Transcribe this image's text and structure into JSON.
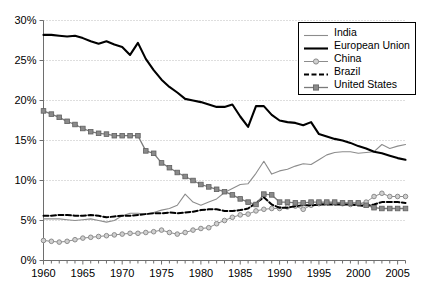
{
  "chart_data": {
    "type": "line",
    "title": "",
    "xlabel": "",
    "ylabel": "",
    "xlim": [
      1960,
      2006
    ],
    "ylim": [
      0,
      30
    ],
    "grid": true,
    "y_tick_labels": [
      "0%",
      "5%",
      "10%",
      "15%",
      "20%",
      "25%",
      "30%"
    ],
    "y_ticks": [
      0,
      5,
      10,
      15,
      20,
      25,
      30
    ],
    "x_tick_labels": [
      "1960",
      "1965",
      "1970",
      "1975",
      "1980",
      "1985",
      "1990",
      "1995",
      "2000",
      "2005"
    ],
    "x_ticks": [
      1960,
      1965,
      1970,
      1975,
      1980,
      1985,
      1990,
      1995,
      2000,
      2005
    ],
    "x_minor_step": 1,
    "legend_position": "top-right",
    "x": [
      1960,
      1961,
      1962,
      1963,
      1964,
      1965,
      1966,
      1967,
      1968,
      1969,
      1970,
      1971,
      1972,
      1973,
      1974,
      1975,
      1976,
      1977,
      1978,
      1979,
      1980,
      1981,
      1982,
      1983,
      1984,
      1985,
      1986,
      1987,
      1988,
      1989,
      1990,
      1991,
      1992,
      1993,
      1994,
      1995,
      1996,
      1997,
      1998,
      1999,
      2000,
      2001,
      2002,
      2003,
      2004,
      2005,
      2006
    ],
    "series": [
      {
        "name": "India",
        "color": "#8c8c8c",
        "style": "solid",
        "width": 1.1,
        "marker": "none",
        "values": [
          5.2,
          5.2,
          5.2,
          5.1,
          5.0,
          5.1,
          5.2,
          5.0,
          4.8,
          5.0,
          5.6,
          5.9,
          5.9,
          5.8,
          6.0,
          6.3,
          6.5,
          6.9,
          8.3,
          7.3,
          6.9,
          7.3,
          7.7,
          8.5,
          9.0,
          9.5,
          9.6,
          10.9,
          12.4,
          10.8,
          11.2,
          11.4,
          11.8,
          12.1,
          12.0,
          12.6,
          13.2,
          13.5,
          13.6,
          13.6,
          13.4,
          13.5,
          13.6,
          14.5,
          14.0,
          14.3,
          14.5
        ]
      },
      {
        "name": "European Union",
        "color": "#000000",
        "style": "solid",
        "width": 2.1,
        "marker": "none",
        "values": [
          28.2,
          28.2,
          28.1,
          28.0,
          28.1,
          27.8,
          27.4,
          27.1,
          27.4,
          27.0,
          26.7,
          25.7,
          27.2,
          25.2,
          23.8,
          22.6,
          21.7,
          21.0,
          20.2,
          20.0,
          19.8,
          19.5,
          19.2,
          19.2,
          19.5,
          18.0,
          16.7,
          19.3,
          19.3,
          18.2,
          17.5,
          17.3,
          17.2,
          16.9,
          17.3,
          15.8,
          15.5,
          15.2,
          15.0,
          14.7,
          14.3,
          14.0,
          13.6,
          13.4,
          13.1,
          12.8,
          12.6
        ]
      },
      {
        "name": "China",
        "color": "#8c8c8c",
        "style": "solid",
        "width": 1.0,
        "marker": "circle",
        "values": [
          2.5,
          2.4,
          2.3,
          2.4,
          2.6,
          2.8,
          2.9,
          3.0,
          3.1,
          3.2,
          3.3,
          3.4,
          3.4,
          3.5,
          3.6,
          3.8,
          3.5,
          3.3,
          3.5,
          3.8,
          4.0,
          4.1,
          4.6,
          5.0,
          5.4,
          5.7,
          5.8,
          6.2,
          6.4,
          6.5,
          6.5,
          6.7,
          6.8,
          6.4,
          6.9,
          7.1,
          7.2,
          7.2,
          7.1,
          7.0,
          7.1,
          7.3,
          8.0,
          8.4,
          8.0,
          8.0,
          8.0
        ]
      },
      {
        "name": "Brazil",
        "color": "#000000",
        "style": "dashed",
        "width": 2.0,
        "marker": "none",
        "values": [
          5.6,
          5.6,
          5.7,
          5.7,
          5.6,
          5.6,
          5.7,
          5.6,
          5.4,
          5.5,
          5.6,
          5.6,
          5.7,
          5.8,
          5.9,
          5.9,
          6.0,
          5.9,
          6.0,
          6.1,
          6.3,
          6.4,
          6.4,
          6.2,
          6.2,
          6.3,
          6.5,
          7.2,
          7.9,
          7.0,
          6.6,
          6.6,
          6.8,
          6.9,
          6.9,
          7.0,
          7.0,
          7.0,
          7.0,
          7.0,
          6.9,
          6.8,
          7.0,
          7.3,
          7.3,
          7.3,
          7.2
        ]
      },
      {
        "name": "United States",
        "color": "#7a7a7a",
        "style": "solid",
        "width": 1.3,
        "marker": "square",
        "values": [
          18.7,
          18.3,
          17.9,
          17.4,
          17.0,
          16.5,
          16.1,
          15.9,
          15.8,
          15.6,
          15.6,
          15.6,
          15.6,
          13.7,
          13.4,
          12.2,
          11.6,
          11.0,
          10.5,
          10.0,
          9.5,
          9.2,
          8.9,
          8.6,
          8.2,
          7.7,
          7.3,
          7.0,
          8.3,
          8.2,
          7.3,
          7.3,
          7.2,
          7.2,
          7.3,
          7.3,
          7.3,
          7.3,
          7.2,
          7.2,
          7.2,
          6.9,
          6.6,
          6.5,
          6.5,
          6.5,
          6.5
        ]
      }
    ]
  },
  "legend": {
    "items": [
      {
        "label": "India"
      },
      {
        "label": "European Union"
      },
      {
        "label": "China"
      },
      {
        "label": "Brazil"
      },
      {
        "label": "United States"
      }
    ]
  },
  "colors": {
    "grid": "#bdbdbd",
    "axis": "#6e6e6e",
    "background": "#ffffff"
  }
}
